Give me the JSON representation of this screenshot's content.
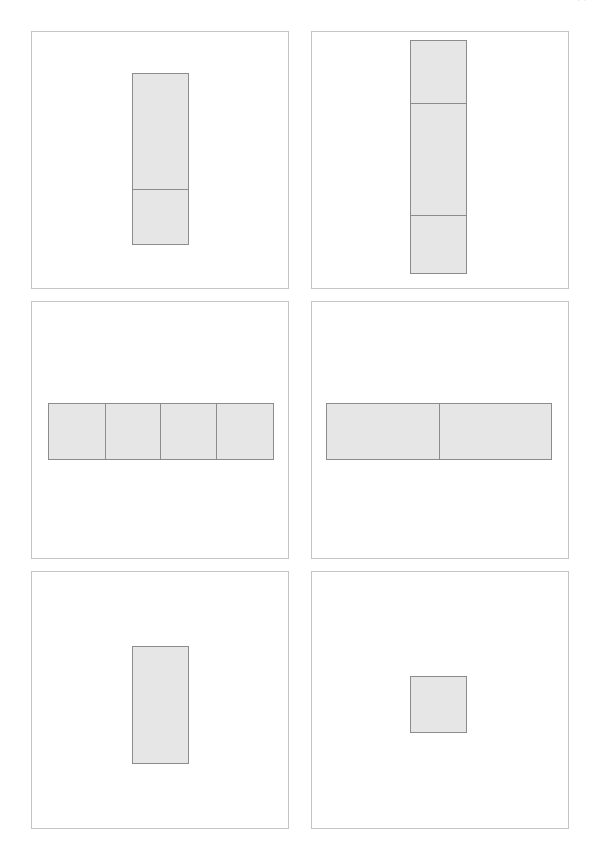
{
  "page": {
    "width": 597,
    "height": 859,
    "background_color": "#ffffff",
    "corner_note": "· ·"
  },
  "style": {
    "panel_border_color": "#c4c4c4",
    "figure_fill_color": "#e6e6e6",
    "figure_border_color": "#8c8c8c"
  },
  "grid": {
    "rows": 3,
    "columns": 2,
    "panel_count": 6
  },
  "panels": [
    {
      "id": "panel-1",
      "position": "top-left",
      "label": "",
      "box": {
        "x": 31,
        "y": 31,
        "width": 258,
        "height": 258
      },
      "figure": {
        "orientation": "vertical",
        "parts": 2,
        "shaded_parts": 2,
        "box": {
          "x": 131,
          "y": 72,
          "width": 57,
          "height": 172
        },
        "cell_sizes": [
          116,
          56
        ],
        "divider_positions": [
          188
        ]
      }
    },
    {
      "id": "panel-2",
      "position": "top-right",
      "label": "",
      "box": {
        "x": 311,
        "y": 31,
        "width": 258,
        "height": 258
      },
      "figure": {
        "orientation": "vertical",
        "parts": 3,
        "shaded_parts": 3,
        "box": {
          "x": 409,
          "y": 39,
          "width": 57,
          "height": 234
        },
        "cell_sizes": [
          63,
          113,
          58
        ],
        "divider_positions": [
          102,
          215
        ]
      }
    },
    {
      "id": "panel-3",
      "position": "middle-left",
      "label": "",
      "box": {
        "x": 31,
        "y": 301,
        "width": 258,
        "height": 258
      },
      "figure": {
        "orientation": "horizontal",
        "parts": 4,
        "shaded_parts": 4,
        "box": {
          "x": 47,
          "y": 402,
          "width": 226,
          "height": 57
        },
        "cell_sizes": [
          56,
          56,
          57,
          57
        ],
        "divider_positions": [
          103,
          159,
          216
        ]
      }
    },
    {
      "id": "panel-4",
      "position": "middle-right",
      "label": "",
      "box": {
        "x": 311,
        "y": 301,
        "width": 258,
        "height": 258
      },
      "figure": {
        "orientation": "horizontal",
        "parts": 2,
        "shaded_parts": 2,
        "box": {
          "x": 325,
          "y": 402,
          "width": 226,
          "height": 57
        },
        "cell_sizes": [
          113,
          113
        ],
        "divider_positions": [
          438
        ]
      }
    },
    {
      "id": "panel-5",
      "position": "bottom-left",
      "label": "",
      "box": {
        "x": 31,
        "y": 571,
        "width": 258,
        "height": 258
      },
      "figure": {
        "orientation": "vertical",
        "parts": 1,
        "shaded_parts": 1,
        "box": {
          "x": 131,
          "y": 645,
          "width": 57,
          "height": 118
        },
        "cell_sizes": [
          118
        ],
        "divider_positions": []
      }
    },
    {
      "id": "panel-6",
      "position": "bottom-right",
      "label": "",
      "box": {
        "x": 311,
        "y": 571,
        "width": 258,
        "height": 258
      },
      "figure": {
        "orientation": "vertical",
        "parts": 1,
        "shaded_parts": 1,
        "box": {
          "x": 409,
          "y": 675,
          "width": 57,
          "height": 57
        },
        "cell_sizes": [
          57
        ],
        "divider_positions": []
      }
    }
  ]
}
